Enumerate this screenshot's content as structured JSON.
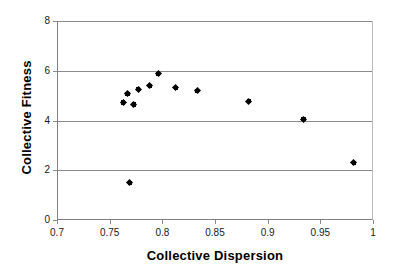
{
  "chart_data": {
    "type": "scatter",
    "title": "",
    "xlabel": "Collective Dispersion",
    "ylabel": "Collective Fitness",
    "xlim": [
      0.7,
      1
    ],
    "ylim": [
      0,
      8
    ],
    "xticks": [
      "0.7",
      "0.75",
      "0.8",
      "0.85",
      "0.9",
      "0.95",
      "1"
    ],
    "xtick_values": [
      0.7,
      0.75,
      0.8,
      0.85,
      0.9,
      0.95,
      1
    ],
    "yticks": [
      "0",
      "2",
      "4",
      "6",
      "8"
    ],
    "ytick_values": [
      0,
      2,
      4,
      6,
      8
    ],
    "grid": "horizontal",
    "legend": "none",
    "marker": "black-diamond",
    "marker_color": "#000000",
    "grid_color": "#8c8c8c",
    "series": [
      {
        "name": "Collective Fitness vs Collective Dispersion",
        "points": [
          {
            "x": 0.762,
            "y": 4.72
          },
          {
            "x": 0.766,
            "y": 5.08
          },
          {
            "x": 0.768,
            "y": 1.5
          },
          {
            "x": 0.772,
            "y": 4.64
          },
          {
            "x": 0.776,
            "y": 5.26
          },
          {
            "x": 0.787,
            "y": 5.4
          },
          {
            "x": 0.795,
            "y": 5.88
          },
          {
            "x": 0.812,
            "y": 5.32
          },
          {
            "x": 0.832,
            "y": 5.2
          },
          {
            "x": 0.881,
            "y": 4.78
          },
          {
            "x": 0.933,
            "y": 4.06
          },
          {
            "x": 0.981,
            "y": 2.3
          }
        ]
      }
    ]
  }
}
